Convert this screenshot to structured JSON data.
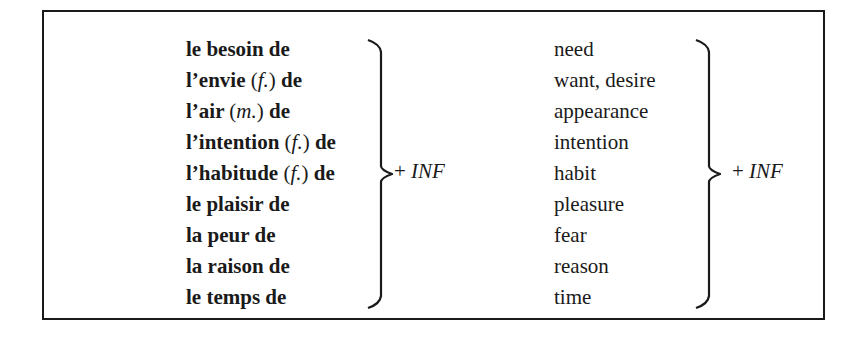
{
  "table": {
    "french_column": [
      {
        "text": "le besoin de",
        "gender": null,
        "suffix": ""
      },
      {
        "text": "l’envie",
        "gender": "f.",
        "suffix": "de"
      },
      {
        "text": "l’air",
        "gender": "m.",
        "suffix": "de"
      },
      {
        "text": "l’intention",
        "gender": "f.",
        "suffix": "de"
      },
      {
        "text": "l’habitude",
        "gender": "f.",
        "suffix": "de"
      },
      {
        "text": "le plaisir de",
        "gender": null,
        "suffix": ""
      },
      {
        "text": "la peur de",
        "gender": null,
        "suffix": ""
      },
      {
        "text": "la raison de",
        "gender": null,
        "suffix": ""
      },
      {
        "text": "le temps de",
        "gender": null,
        "suffix": ""
      }
    ],
    "english_column": [
      "need",
      "want, desire",
      "appearance",
      "intention",
      "habit",
      "pleasure",
      "fear",
      "reason",
      "time"
    ],
    "french_brace_label": {
      "plus": "+",
      "inf": "INF"
    },
    "english_brace_label": {
      "plus": "+",
      "inf": "INF"
    }
  }
}
